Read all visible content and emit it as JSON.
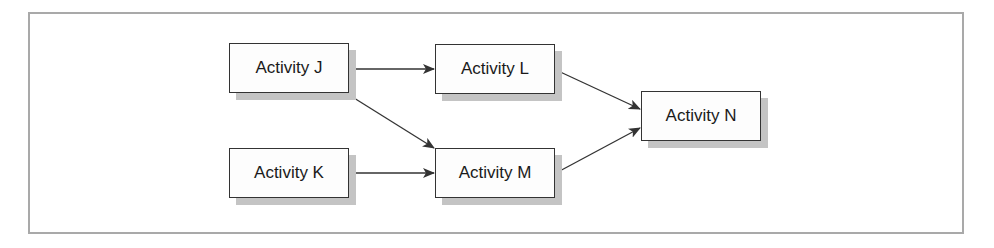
{
  "diagram": {
    "type": "activity-network",
    "nodes": [
      {
        "id": "J",
        "label": "Activity J"
      },
      {
        "id": "K",
        "label": "Activity K"
      },
      {
        "id": "L",
        "label": "Activity L"
      },
      {
        "id": "M",
        "label": "Activity M"
      },
      {
        "id": "N",
        "label": "Activity N"
      }
    ],
    "edges": [
      {
        "from": "J",
        "to": "L"
      },
      {
        "from": "J",
        "to": "M"
      },
      {
        "from": "K",
        "to": "M"
      },
      {
        "from": "L",
        "to": "N"
      },
      {
        "from": "M",
        "to": "N"
      }
    ]
  },
  "colors": {
    "frame_border": "#a9a9a9",
    "node_border": "#333333",
    "node_shadow": "#c4c4c4",
    "arrow": "#333333"
  }
}
